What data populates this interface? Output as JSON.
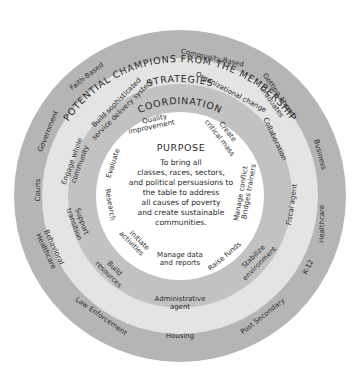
{
  "diagram": {
    "colors": {
      "outer_ring": "#b5b5b5",
      "strategies_ring": "#e4e4e4",
      "coordination_ring": "#c2c2c2",
      "purpose_center": "#ffffff",
      "text": "#2a2a2a"
    },
    "outer_ring": {
      "title": "POTENTIAL CHAMPIONS FROM THE MEMBERSHIP",
      "items": [
        "Faith-Based",
        "Community-Based",
        "Getting Ahead",
        "Graduates",
        "Business",
        "Healthcare",
        "K-12",
        "Post Secondary",
        "Housing",
        "Law Enforcement",
        "Behavioral",
        "Healthcare",
        "Courts",
        "Government"
      ]
    },
    "strategies_ring": {
      "title": "STRATEGIES",
      "items": [
        "Build sophisticated",
        "service delivery system",
        "Organizational change",
        "Collaboration",
        "Fiscal agent",
        "Stabilize",
        "environment",
        "Administrative",
        "agent",
        "Build",
        "resources",
        "Support",
        "transition",
        "Engage whole",
        "community"
      ]
    },
    "coordination_ring": {
      "title": "COORDINATION",
      "items": [
        "Quality",
        "improvement",
        "Create",
        "critical mass",
        "Manage conflict",
        "Bridges trainers",
        "Raise funds",
        "Manage data",
        "and reports",
        "Initiate",
        "activities",
        "Research",
        "Evaluate"
      ]
    },
    "purpose": {
      "title": "PURPOSE",
      "lines": [
        "To bring all",
        "classes, races, sectors,",
        "and political persuasions to",
        "the table to address",
        "all causes of poverty",
        "and create sustainable",
        "communities."
      ]
    }
  }
}
